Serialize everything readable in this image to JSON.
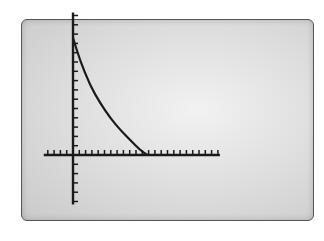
{
  "chart_data": {
    "type": "line",
    "title": "",
    "xlabel": "",
    "ylabel": "",
    "grid": false,
    "legend": null,
    "x_tick_count_right": 23,
    "x_tick_count_left": 4,
    "y_tick_count_up": 15,
    "y_tick_count_down": 5,
    "series": [
      {
        "name": "curve",
        "points_in_tick_units": [
          {
            "x": 0,
            "y": 12.6
          },
          {
            "x": 1.1,
            "y": 10.2
          },
          {
            "x": 2.7,
            "y": 7.5
          },
          {
            "x": 4.3,
            "y": 5.6
          },
          {
            "x": 5.9,
            "y": 4.0
          },
          {
            "x": 7.5,
            "y": 2.7
          },
          {
            "x": 9.1,
            "y": 1.6
          },
          {
            "x": 10.7,
            "y": 0.5
          },
          {
            "x": 11.8,
            "y": 0
          }
        ]
      }
    ]
  },
  "colors": {
    "axis": "#1a1a1a",
    "curve": "#1a1a1a",
    "screen_border": "#555555",
    "screen_bg": "#dcdcdc"
  }
}
